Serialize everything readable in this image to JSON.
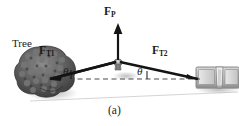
{
  "figure": {
    "caption": "(a)",
    "background_color": "#ffffff",
    "ink_color": "#1a1a1a",
    "width": 239,
    "height": 126
  },
  "labels": {
    "tree": "Tree",
    "force_rope_left": {
      "symbol": "F",
      "subscript": "T1"
    },
    "force_pull": {
      "symbol": "F",
      "subscript": "P"
    },
    "force_rope_right": {
      "symbol": "F",
      "subscript": "T2"
    },
    "angle_left": "θ",
    "angle_right": "θ"
  },
  "objects": {
    "tree": {
      "name": "Tree",
      "fill": "#555555",
      "position": "left"
    },
    "car": {
      "name": "Car",
      "fill": "#b0b0b0",
      "position": "right"
    },
    "hand_grip": {
      "name": "Hand grip at rope midpoint",
      "fill": "#9a9a9a"
    }
  },
  "vectors": [
    {
      "name": "F_T1",
      "label": "F",
      "subscript": "T1",
      "direction": "up-left",
      "from": "rope-midpoint",
      "to": "tree"
    },
    {
      "name": "F_P",
      "label": "F",
      "subscript": "P",
      "direction": "up",
      "from": "rope-midpoint",
      "to": "above"
    },
    {
      "name": "F_T2",
      "label": "F",
      "subscript": "T2",
      "direction": "down-right",
      "from": "rope-midpoint",
      "to": "car"
    }
  ],
  "guides": {
    "dashed_axis": {
      "name": "horizontal-reference-line",
      "style": "dashed",
      "color": "#555555"
    },
    "ground_line": {
      "name": "ground-line",
      "style": "solid",
      "color": "#cccccc"
    }
  }
}
